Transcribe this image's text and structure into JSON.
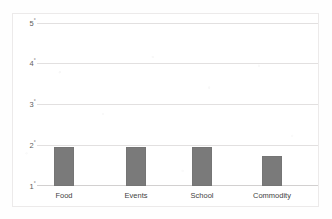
{
  "chart_data": {
    "type": "bar",
    "title": "",
    "subtitle": "",
    "xlabel": "",
    "ylabel": "",
    "categories": [
      "Food",
      "Events",
      "School",
      "Commodity"
    ],
    "values": [
      1.95,
      1.95,
      1.95,
      1.73
    ],
    "series": [
      {
        "name": "",
        "values": [
          1.95,
          1.95,
          1.95,
          1.73
        ]
      }
    ],
    "ylim": [
      1,
      5
    ],
    "yticks": [
      1,
      2,
      3,
      4,
      5
    ],
    "ytick_labels": [
      "1°",
      "2°",
      "3°",
      "4°",
      "5°"
    ],
    "ytick_number_labels": [
      "1",
      "2",
      "3",
      "4",
      "5"
    ],
    "ytick_unit": "°",
    "grid": true,
    "grid_axis": "y",
    "legend": false,
    "legend_position": "none",
    "annotations": []
  },
  "style": {
    "bar_color": "#7a7a7a",
    "bar_border_color": "#757575",
    "gridline_color": "#e2e0e0",
    "baseline_color": "#d2d0d0",
    "frame_color": "#eceaea",
    "background_color": "#ffffff",
    "tick_label_color": "#5d5d5d",
    "category_label_color": "#3f3f3f"
  }
}
